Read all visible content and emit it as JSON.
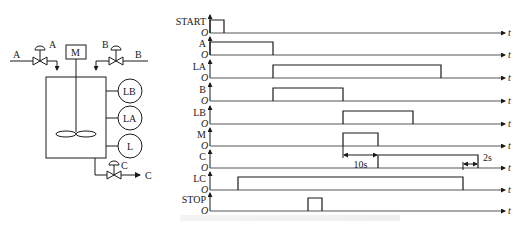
{
  "process_diagram": {
    "inlet_a": {
      "line_label": "A",
      "valve_label": "A"
    },
    "inlet_b": {
      "line_label": "B",
      "valve_label": "B"
    },
    "motor_label": "M",
    "level_sensors": [
      "LB",
      "LA",
      "L"
    ],
    "outlet": {
      "valve_label": "C",
      "line_label": "C"
    }
  },
  "timing_diagram": {
    "origin_label": "O",
    "time_label": "t",
    "signals": [
      {
        "name": "START",
        "baseline_y": 33,
        "pulses": [
          [
            210,
            224
          ]
        ]
      },
      {
        "name": "A",
        "baseline_y": 55,
        "pulses": [
          [
            210,
            273
          ]
        ]
      },
      {
        "name": "LA",
        "baseline_y": 78,
        "pulses": [
          [
            273,
            441
          ]
        ]
      },
      {
        "name": "B",
        "baseline_y": 101,
        "pulses": [
          [
            273,
            343
          ]
        ]
      },
      {
        "name": "LB",
        "baseline_y": 124,
        "pulses": [
          [
            343,
            413
          ]
        ]
      },
      {
        "name": "M",
        "baseline_y": 146,
        "pulses": [
          [
            343,
            378
          ]
        ]
      },
      {
        "name": "C",
        "baseline_y": 168,
        "pulses": [
          [
            378,
            478
          ]
        ]
      },
      {
        "name": "LC",
        "baseline_y": 190,
        "pulses": [
          [
            238,
            463
          ]
        ]
      },
      {
        "name": "STOP",
        "baseline_y": 211,
        "pulses": [
          [
            308,
            322
          ]
        ]
      }
    ],
    "annotations": [
      {
        "text": "10s",
        "from_x": 343,
        "to_x": 378
      },
      {
        "text": "2s",
        "from_x": 463,
        "to_x": 478
      }
    ]
  }
}
